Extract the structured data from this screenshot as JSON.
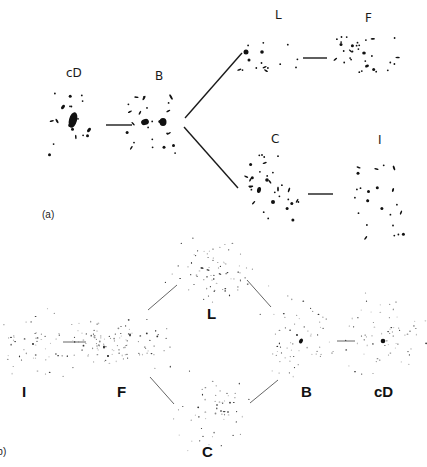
{
  "figure": {
    "panel_a": {
      "tag": "(a)",
      "nodes": [
        {
          "id": "cD",
          "label": "cD",
          "label_pos": [
            66,
            67
          ],
          "center": [
            73,
            123
          ]
        },
        {
          "id": "B",
          "label": "B",
          "label_pos": [
            155,
            70
          ],
          "center": [
            155,
            122
          ]
        },
        {
          "id": "L",
          "label": "L",
          "label_pos": [
            275,
            9
          ],
          "center": [
            290,
            55
          ]
        },
        {
          "id": "F",
          "label": "F",
          "label_pos": [
            365,
            12
          ],
          "center": [
            375,
            58
          ]
        },
        {
          "id": "C",
          "label": "C",
          "label_pos": [
            271,
            133
          ],
          "center": [
            285,
            190
          ]
        },
        {
          "id": "I",
          "label": "I",
          "label_pos": [
            378,
            134
          ],
          "center": [
            375,
            195
          ]
        }
      ],
      "edges": [
        {
          "from": "cD",
          "to": "B",
          "line": [
            106,
            125,
            132,
            125
          ]
        },
        {
          "from": "B",
          "to": "L",
          "line": [
            185,
            118,
            242,
            53
          ]
        },
        {
          "from": "B",
          "to": "C",
          "line": [
            184,
            127,
            238,
            188
          ]
        },
        {
          "from": "L",
          "to": "F",
          "line": [
            303,
            58,
            327,
            58
          ]
        },
        {
          "from": "C",
          "to": "I",
          "line": [
            308,
            194,
            333,
            194
          ]
        }
      ]
    },
    "panel_b": {
      "tag": "(b)",
      "nodes": [
        {
          "id": "I",
          "label": "I",
          "label_pos": [
            22,
            384
          ],
          "center": [
            30,
            343
          ]
        },
        {
          "id": "F",
          "label": "F",
          "label_pos": [
            117,
            384
          ],
          "center": [
            118,
            342
          ]
        },
        {
          "id": "L",
          "label": "L",
          "label_pos": [
            207,
            306
          ],
          "center": [
            213,
            270
          ]
        },
        {
          "id": "C",
          "label": "C",
          "label_pos": [
            202,
            444
          ],
          "center": [
            214,
            410
          ]
        },
        {
          "id": "B",
          "label": "B",
          "label_pos": [
            301,
            384
          ],
          "center": [
            300,
            340
          ]
        },
        {
          "id": "cD",
          "label": "cD",
          "label_pos": [
            374,
            384
          ],
          "center": [
            383,
            340
          ]
        }
      ],
      "edges": [
        {
          "from": "I",
          "to": "F",
          "line": [
            63,
            342,
            86,
            342
          ]
        },
        {
          "from": "F",
          "to": "L",
          "line": [
            148,
            310,
            177,
            285
          ]
        },
        {
          "from": "L",
          "to": "B",
          "line": [
            247,
            280,
            271,
            307
          ]
        },
        {
          "from": "F",
          "to": "C",
          "line": [
            150,
            377,
            174,
            404
          ]
        },
        {
          "from": "C",
          "to": "B",
          "line": [
            250,
            403,
            278,
            380
          ]
        },
        {
          "from": "B",
          "to": "cD",
          "line": [
            337,
            341,
            355,
            341
          ]
        }
      ]
    }
  },
  "colors": {
    "ink": "#111111",
    "line_a": "#1a1a1a",
    "line_b": "#555555",
    "background": "#ffffff"
  }
}
